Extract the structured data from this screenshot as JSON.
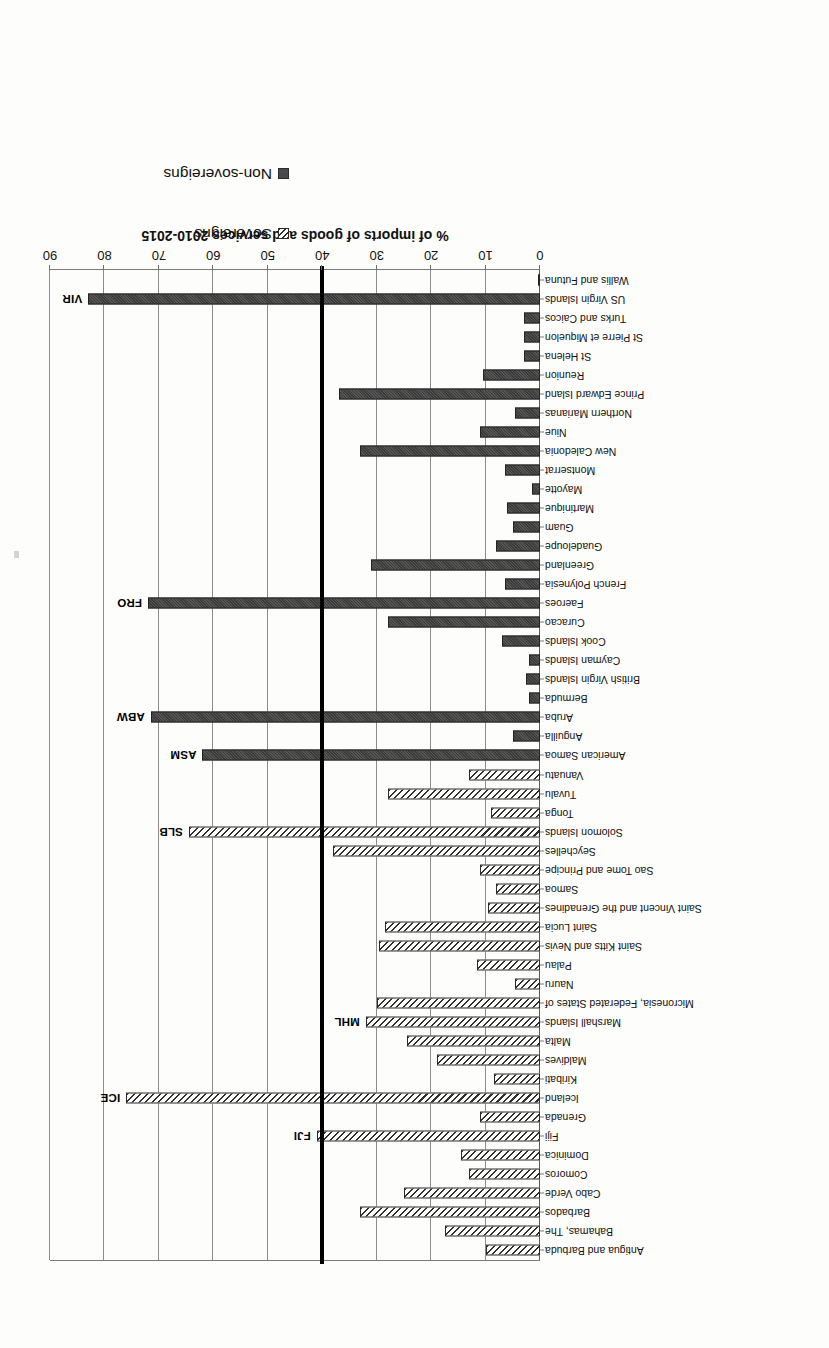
{
  "chart_data": {
    "type": "bar",
    "orientation": "horizontal",
    "title": "",
    "xlabel": "% of imports of goods and services 2010-2015",
    "ylabel": "",
    "xlim": [
      0,
      90
    ],
    "xticks": [
      0,
      10,
      20,
      30,
      40,
      50,
      60,
      70,
      80,
      90
    ],
    "grid": true,
    "reference_line": {
      "value": 40,
      "style": "thick-black"
    },
    "legend": {
      "position": "top-left",
      "entries": [
        {
          "name": "Sovereigns",
          "pattern": "diagonal-hatch"
        },
        {
          "name": "Non-sovereigns",
          "pattern": "solid-dark"
        }
      ]
    },
    "categories": [
      "Antigua and Barbuda",
      "Bahamas, The",
      "Barbados",
      "Cabo Verde",
      "Comoros",
      "Dominica",
      "Fiji",
      "Grenada",
      "Iceland",
      "Kiribati",
      "Maldives",
      "Malta",
      "Marshall Islands",
      "Micronesia, Federated States of",
      "Nauru",
      "Palau",
      "Saint Kitts and Nevis",
      "Saint Lucia",
      "Saint Vincent and the Grenadines",
      "Samoa",
      "Sao Tome and Principe",
      "Seychelles",
      "Solomon Islands",
      "Tonga",
      "Tuvalu",
      "Vanuatu",
      "American Samoa",
      "Anguilla",
      "Aruba",
      "Bermuda",
      "British Virgin Islands",
      "Cayman Islands",
      "Cook Islands",
      "Curacao",
      "Faeroes",
      "French Polynesia",
      "Greenland",
      "Guadeloupe",
      "Guam",
      "Martinique",
      "Mayotte",
      "Montserrat",
      "New Caledonia",
      "Niue",
      "Northern Marianas",
      "Prince Edward Island",
      "Reunion",
      "St Helena",
      "St Pierre et Miquelon",
      "Turks and Caicos",
      "US Virgin Islands",
      "Wallis and Futuna"
    ],
    "series": [
      {
        "name": "Sovereigns",
        "pattern": "diagonal-hatch",
        "values": [
          10.0,
          17.5,
          33.0,
          25.0,
          13.0,
          14.5,
          41.0,
          11.0,
          76.0,
          8.5,
          19.0,
          24.5,
          32.0,
          30.0,
          4.5,
          11.5,
          29.5,
          28.5,
          9.5,
          8.0,
          11.0,
          38.0,
          64.5,
          9.0,
          28.0,
          13.0,
          null,
          null,
          null,
          null,
          null,
          null,
          null,
          null,
          null,
          null,
          null,
          null,
          null,
          null,
          null,
          null,
          null,
          null,
          null,
          null,
          null,
          null,
          null,
          null,
          null,
          null
        ]
      },
      {
        "name": "Non-sovereigns",
        "pattern": "solid-dark",
        "values": [
          null,
          null,
          null,
          null,
          null,
          null,
          null,
          null,
          null,
          null,
          null,
          null,
          null,
          null,
          null,
          null,
          null,
          null,
          null,
          null,
          null,
          null,
          null,
          null,
          null,
          null,
          62.0,
          5.0,
          71.5,
          2.0,
          2.5,
          2.0,
          7.0,
          28.0,
          72.0,
          6.5,
          31.0,
          8.0,
          5.0,
          6.0,
          1.5,
          6.5,
          33.0,
          11.0,
          4.5,
          37.0,
          10.5,
          3.0,
          3.0,
          3.0,
          83.0,
          0.0
        ]
      }
    ],
    "annotations": [
      {
        "code": "FJI",
        "category": "Fiji"
      },
      {
        "code": "ICE",
        "category": "Iceland"
      },
      {
        "code": "MHL",
        "category": "Marshall Islands"
      },
      {
        "code": "SLB",
        "category": "Solomon Islands"
      },
      {
        "code": "ASM",
        "category": "American Samoa"
      },
      {
        "code": "ABW",
        "category": "Aruba"
      },
      {
        "code": "FRO",
        "category": "Faeroes"
      },
      {
        "code": "VIR",
        "category": "US Virgin Islands"
      }
    ],
    "colors": {
      "sovereign_hatch": "#2f2f2f",
      "nonsovereign_fill": "#4a4a4a",
      "reference_line": "#000000",
      "gridline": "#8c8c8c",
      "text": "#111111",
      "background": "#fdfdfb"
    }
  }
}
